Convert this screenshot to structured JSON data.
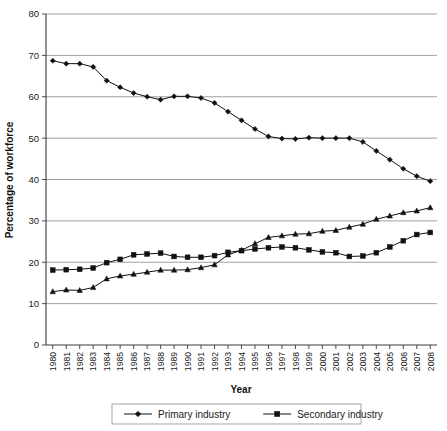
{
  "chart_data": {
    "type": "line",
    "title": "",
    "xlabel": "Year",
    "ylabel": "Percentage of workforce",
    "ylim": [
      0,
      80
    ],
    "ytick_values": [
      0,
      10,
      20,
      30,
      40,
      50,
      60,
      70,
      80
    ],
    "grid": true,
    "legend_position": "bottom",
    "categories": [
      "1980",
      "1981",
      "1982",
      "1983",
      "1984",
      "1985",
      "1986",
      "1987",
      "1988",
      "1989",
      "1990",
      "1991",
      "1992",
      "1993",
      "1994",
      "1995",
      "1996",
      "1997",
      "1998",
      "1999",
      "2000",
      "2001",
      "2002",
      "2003",
      "2004",
      "2005",
      "2006",
      "2007",
      "2008"
    ],
    "series": [
      {
        "name": "Primary industry",
        "marker": "diamond",
        "in_legend": true,
        "values": [
          68.7,
          68.0,
          68.0,
          67.2,
          63.9,
          62.3,
          60.9,
          60.0,
          59.3,
          60.1,
          60.1,
          59.7,
          58.5,
          56.4,
          54.3,
          52.2,
          50.4,
          49.9,
          49.8,
          50.1,
          50.0,
          50.0,
          50.0,
          49.1,
          46.9,
          44.8,
          42.6,
          40.8,
          39.6
        ]
      },
      {
        "name": "Secondary industry",
        "marker": "square",
        "in_legend": true,
        "values": [
          18.1,
          18.2,
          18.3,
          18.6,
          19.9,
          20.7,
          21.8,
          22.0,
          22.2,
          21.4,
          21.2,
          21.2,
          21.6,
          22.4,
          22.8,
          23.2,
          23.5,
          23.7,
          23.5,
          23.0,
          22.5,
          22.3,
          21.4,
          21.5,
          22.3,
          23.7,
          25.2,
          26.7,
          27.2
        ]
      },
      {
        "name": "",
        "marker": "triangle",
        "in_legend": false,
        "values": [
          12.9,
          13.3,
          13.2,
          13.9,
          16.0,
          16.7,
          17.1,
          17.6,
          18.1,
          18.1,
          18.2,
          18.7,
          19.4,
          21.8,
          22.9,
          24.5,
          26.0,
          26.4,
          26.8,
          26.9,
          27.5,
          27.7,
          28.5,
          29.2,
          30.4,
          31.2,
          32.0,
          32.4,
          33.2
        ]
      }
    ]
  },
  "legend": {
    "entries": [
      {
        "label": "Primary industry",
        "marker": "diamond-marker-icon"
      },
      {
        "label": "Secondary industry",
        "marker": "square-marker-icon"
      }
    ]
  },
  "axes": {
    "x_title": "Year",
    "y_title": "Percentage of workforce"
  },
  "colors": {
    "series": "#111111",
    "grid": "#8a8a8a",
    "axis": "#3a3a3a",
    "background": "#ffffff"
  }
}
